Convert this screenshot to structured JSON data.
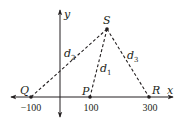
{
  "diagram": {
    "axes": {
      "x_label": "x",
      "y_label": "y"
    },
    "tick_labels": [
      "-100",
      "100",
      "300"
    ],
    "points": {
      "Q": {
        "label": "Q",
        "x_value": -100
      },
      "P": {
        "label": "P",
        "x_value": 100
      },
      "R": {
        "label": "R",
        "x_value": 300
      },
      "S": {
        "label": "S"
      }
    },
    "segments": [
      {
        "name": "d1",
        "base": "d",
        "sub": "1",
        "from": "S",
        "to": "P"
      },
      {
        "name": "d2",
        "base": "d",
        "sub": "2",
        "from": "S",
        "to": "Q"
      },
      {
        "name": "d3",
        "base": "d",
        "sub": "3",
        "from": "S",
        "to": "R"
      }
    ],
    "color": "#231f20"
  }
}
